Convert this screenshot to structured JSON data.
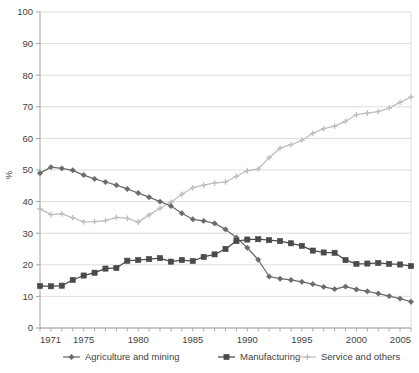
{
  "chart_data": {
    "type": "line",
    "title": "",
    "subtitle": "",
    "xlabel": "",
    "ylabel": "%",
    "xlim": [
      1971,
      2005
    ],
    "ylim": [
      0,
      100
    ],
    "ytick_step": 10,
    "yticks": [
      "0",
      "10",
      "20",
      "30",
      "40",
      "50",
      "60",
      "70",
      "80",
      "90",
      "100"
    ],
    "xticks_major": [
      "1971",
      "1975",
      "1980",
      "1985",
      "1990",
      "1995",
      "2000",
      "2005"
    ],
    "grid": "horizontal",
    "legend_position": "bottom",
    "x": [
      1971,
      1972,
      1973,
      1974,
      1975,
      1976,
      1977,
      1978,
      1979,
      1980,
      1981,
      1982,
      1983,
      1984,
      1985,
      1986,
      1987,
      1988,
      1989,
      1990,
      1991,
      1992,
      1993,
      1994,
      1995,
      1996,
      1997,
      1998,
      1999,
      2000,
      2001,
      2002,
      2003,
      2004,
      2005
    ],
    "series": [
      {
        "name": "Agriculture and mining",
        "color": "#6b6b6b",
        "marker": "diamond",
        "values": [
          49.0,
          50.9,
          50.5,
          49.9,
          48.4,
          47.2,
          46.2,
          45.2,
          44.0,
          42.7,
          41.4,
          40.0,
          38.6,
          36.3,
          34.4,
          33.9,
          33.1,
          31.2,
          28.6,
          25.4,
          21.6,
          16.3,
          15.6,
          15.2,
          14.6,
          13.9,
          13.0,
          12.3,
          13.1,
          12.2,
          11.6,
          10.9,
          10.1,
          9.3,
          8.3
        ]
      },
      {
        "name": "Manufacturing",
        "color": "#4a4a4a",
        "marker": "square",
        "values": [
          13.3,
          13.2,
          13.4,
          15.2,
          16.6,
          17.5,
          18.8,
          19.0,
          21.3,
          21.5,
          21.8,
          22.1,
          21.0,
          21.5,
          21.2,
          22.5,
          23.3,
          25.0,
          27.5,
          28.0,
          28.1,
          27.8,
          27.5,
          26.8,
          26.0,
          24.5,
          23.9,
          23.8,
          21.5,
          20.3,
          20.4,
          20.6,
          20.3,
          20.1,
          19.6
        ]
      },
      {
        "name": "Service and others",
        "color": "#bdbdbd",
        "marker": "cross",
        "values": [
          37.7,
          35.9,
          36.1,
          34.9,
          33.6,
          33.7,
          34.0,
          35.0,
          34.7,
          33.5,
          35.8,
          37.9,
          39.8,
          42.3,
          44.4,
          45.2,
          45.9,
          46.2,
          48.0,
          49.8,
          50.3,
          53.9,
          56.9,
          58.0,
          59.4,
          61.6,
          63.1,
          63.9,
          65.4,
          67.5,
          68.0,
          68.5,
          69.6,
          71.4,
          73.1
        ]
      }
    ]
  },
  "legend": {
    "items": [
      {
        "label": "Agriculture and mining"
      },
      {
        "label": "Manufacturing"
      },
      {
        "label": "Service and others"
      }
    ]
  }
}
